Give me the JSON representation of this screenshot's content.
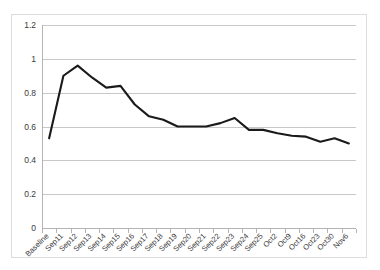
{
  "chart_data": {
    "type": "line",
    "title": "",
    "title_note": "chart title is cropped off the top edge of the screenshot and is illegible",
    "xlabel": "",
    "ylabel": "",
    "ylim": [
      0,
      1.2
    ],
    "ytick_labels": [
      "1.2",
      "1",
      "0.8",
      "0.6",
      "0.4",
      "0.2",
      "0"
    ],
    "ytick_values": [
      1.2,
      1.0,
      0.8,
      0.6,
      0.4,
      0.2,
      0.0
    ],
    "grid": true,
    "grid_axis": "y",
    "legend": false,
    "legend_position": "none",
    "markers": false,
    "categories": [
      "Baseline",
      "Sep11",
      "Sep12",
      "Sep13",
      "Sep14",
      "Sep15",
      "Sep16",
      "Sep17",
      "Sep18",
      "Sep19",
      "Sep20",
      "Sep21",
      "Sep22",
      "Sep23",
      "Sep24",
      "Sep25",
      "Oct2",
      "Oct9",
      "Oct16",
      "Oct23",
      "Oct30",
      "Nov6"
    ],
    "series": [
      {
        "name": "",
        "color": "#1a1a1a",
        "values": [
          0.53,
          0.9,
          0.96,
          0.89,
          0.83,
          0.84,
          0.73,
          0.66,
          0.64,
          0.6,
          0.6,
          0.6,
          0.62,
          0.65,
          0.58,
          0.58,
          0.56,
          0.545,
          0.54,
          0.51,
          0.53,
          0.5
        ]
      }
    ]
  },
  "colors": {
    "background": "#ffffff",
    "frame_border": "#dcdcdc",
    "gridline": "#c8c8c8",
    "axis": "#b4b4b4",
    "line": "#1a1a1a",
    "tick_label": "#3a3a3a"
  }
}
